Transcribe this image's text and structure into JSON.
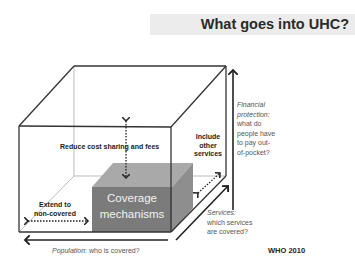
{
  "slide": {
    "title": "What goes into UHC?",
    "source": "WHO 2010"
  },
  "diagram": {
    "inner_box_label_line1": "Coverage",
    "inner_box_label_line2": "mechanisms",
    "labels": {
      "reduce_cost": "Reduce cost sharing and fees",
      "include_line1": "Include",
      "include_line2": "other",
      "include_line3": "services",
      "extend_line1": "Extend to",
      "extend_line2": "non-covered"
    },
    "axes": {
      "financial_line1": "Financial",
      "financial_line2": "protection:",
      "financial_line3": "what do",
      "financial_line4": "people have",
      "financial_line5": "to pay out-",
      "financial_line6": "of-pocket?",
      "services_line1": "Services:",
      "services_line2": "which services",
      "services_line3": "are covered?",
      "population_italic": "Population",
      "population_rest": ": who is covered?"
    },
    "colors": {
      "inner_front": "#7b7b7b",
      "inner_top": "#a9a9a9",
      "inner_side": "#8e8e8e",
      "lines": "#333333"
    }
  }
}
